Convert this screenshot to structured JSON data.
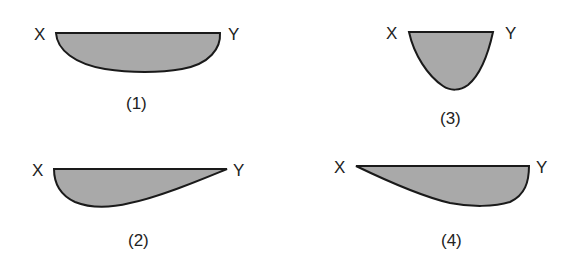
{
  "diagram": {
    "fill_color": "#a9a9a9",
    "stroke_color": "#1a1a1a",
    "shapes": [
      {
        "id": "1",
        "caption": "(1)",
        "left_label": "X",
        "right_label": "Y",
        "description": "symmetric shallow sag"
      },
      {
        "id": "2",
        "caption": "(2)",
        "left_label": "X",
        "right_label": "Y",
        "description": "deepest near X, tapering to Y"
      },
      {
        "id": "3",
        "caption": "(3)",
        "left_label": "X",
        "right_label": "Y",
        "description": "narrow deep U shape"
      },
      {
        "id": "4",
        "caption": "(4)",
        "left_label": "X",
        "right_label": "Y",
        "description": "tapering from X, deepest near Y"
      }
    ]
  }
}
